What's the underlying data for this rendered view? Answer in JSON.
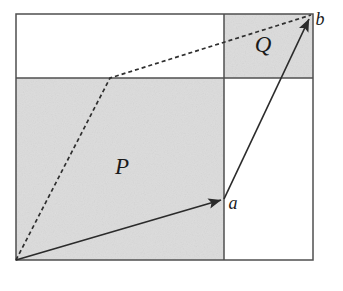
{
  "figure": {
    "background_color": "#ffffff",
    "line_color": "#4a4a4a",
    "vector_color": "#333333",
    "shade_color": "#e2e2e2",
    "shade_speckle_color": "#bdbdbd",
    "canvas": {
      "width": 343,
      "height": 291
    },
    "frame": {
      "x1": 16,
      "y1": 14,
      "x2": 313,
      "y2": 260
    },
    "divider_horizontal_y": 78,
    "divider_vertical_x": 224,
    "shaded_regions": [
      {
        "name": "P-region",
        "x1": 16,
        "y1": 78,
        "x2": 224,
        "y2": 260
      },
      {
        "name": "Q-region",
        "x1": 224,
        "y1": 14,
        "x2": 313,
        "y2": 78
      }
    ],
    "labels": [
      {
        "id": "P",
        "text": "P",
        "x": 122,
        "y": 174,
        "size": "upper"
      },
      {
        "id": "Q",
        "text": "Q",
        "x": 263,
        "y": 52,
        "size": "upper"
      },
      {
        "id": "a",
        "text": "a",
        "x": 233,
        "y": 209,
        "size": "lower"
      },
      {
        "id": "b",
        "text": "b",
        "x": 317,
        "y": 25,
        "size": "lower"
      }
    ],
    "vectors": [
      {
        "id": "vector-a",
        "label": "a",
        "from": [
          16,
          260
        ],
        "to": [
          224,
          199
        ],
        "style": "solid"
      },
      {
        "id": "vector-b",
        "label": "b",
        "from": [
          224,
          199
        ],
        "to": [
          312,
          14
        ],
        "style": "solid"
      }
    ],
    "dashed_path": {
      "id": "dashed-diagonal",
      "points": [
        [
          16,
          260
        ],
        [
          110,
          78
        ],
        [
          312,
          14
        ]
      ],
      "style": "dashed",
      "dash_pattern": "4 3"
    }
  }
}
